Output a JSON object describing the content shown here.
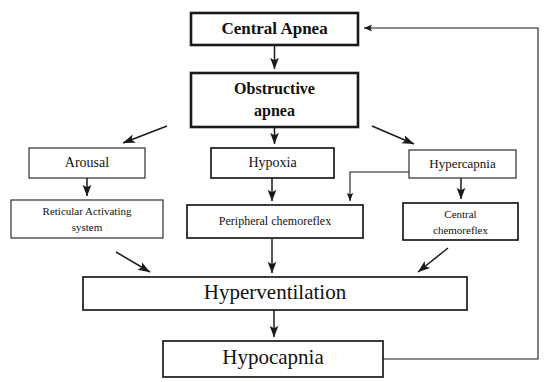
{
  "diagram": {
    "background_color": "#ffffff",
    "line_color": "#1a1a1a",
    "nodes": [
      {
        "id": "central-apnea",
        "label": "Central Apnea",
        "bold": true,
        "x": 191,
        "y": 13,
        "w": 167,
        "h": 32,
        "font_size": 17,
        "lines": [
          "Central Apnea"
        ]
      },
      {
        "id": "obstructive-apnea",
        "label": "Obstructive apnea",
        "bold": true,
        "x": 191,
        "y": 73,
        "w": 167,
        "h": 54,
        "font_size": 16,
        "lines": [
          "Obstructive",
          "apnea"
        ]
      },
      {
        "id": "arousal",
        "label": "Arousal",
        "bold": false,
        "x": 29,
        "y": 148,
        "w": 116,
        "h": 30,
        "font_size": 14,
        "lines": [
          "Arousal"
        ]
      },
      {
        "id": "hypoxia",
        "label": "Hypoxia",
        "bold": false,
        "x": 211,
        "y": 148,
        "w": 123,
        "h": 30,
        "font_size": 14,
        "lines": [
          "Hypoxia"
        ]
      },
      {
        "id": "hypercapnia",
        "label": "Hypercapnia",
        "bold": false,
        "x": 409,
        "y": 150,
        "w": 107,
        "h": 28,
        "font_size": 13,
        "lines": [
          "Hypercapnia"
        ]
      },
      {
        "id": "reticular-activating",
        "label": "Reticular Activating system",
        "bold": false,
        "x": 11,
        "y": 200,
        "w": 152,
        "h": 38,
        "font_size": 11,
        "lines": [
          "Reticular Activating",
          "system"
        ]
      },
      {
        "id": "peripheral-chemoreflex",
        "label": "Peripheral chemoreflex",
        "bold": false,
        "x": 187,
        "y": 205,
        "w": 176,
        "h": 33,
        "font_size": 12,
        "lines": [
          "Peripheral chemoreflex"
        ]
      },
      {
        "id": "central-chemoreflex",
        "label": "Central chemoreflex",
        "bold": false,
        "x": 403,
        "y": 203,
        "w": 115,
        "h": 37,
        "font_size": 11,
        "lines": [
          "Central",
          "chemoreflex"
        ]
      },
      {
        "id": "hyperventilation",
        "label": "Hyperventilation",
        "bold": false,
        "x": 83,
        "y": 277,
        "w": 384,
        "h": 33,
        "font_size": 21,
        "lines": [
          "Hyperventilation"
        ]
      },
      {
        "id": "hypocapnia",
        "label": "Hypocapnia",
        "bold": false,
        "x": 163,
        "y": 341,
        "w": 220,
        "h": 36,
        "font_size": 21,
        "lines": [
          "Hypocapnia"
        ]
      }
    ],
    "edges": [
      {
        "id": "central-to-obstructive",
        "from": "central-apnea",
        "to": "obstructive-apnea",
        "kind": "straight-down"
      },
      {
        "id": "obstructive-to-arousal",
        "from": "obstructive-apnea",
        "to": "arousal",
        "kind": "diagonal-left"
      },
      {
        "id": "obstructive-to-hypoxia",
        "from": "obstructive-apnea",
        "to": "hypoxia",
        "kind": "straight-down"
      },
      {
        "id": "obstructive-to-hypercapnia",
        "from": "obstructive-apnea",
        "to": "hypercapnia",
        "kind": "diagonal-right"
      },
      {
        "id": "arousal-to-reticular",
        "from": "arousal",
        "to": "reticular-activating",
        "kind": "straight-down"
      },
      {
        "id": "hypoxia-to-peripheral",
        "from": "hypoxia",
        "to": "peripheral-chemoreflex",
        "kind": "straight-down"
      },
      {
        "id": "hypercapnia-to-peripheral",
        "from": "hypercapnia",
        "to": "peripheral-chemoreflex",
        "kind": "elbow-left-down"
      },
      {
        "id": "hypercapnia-to-central-chemo",
        "from": "hypercapnia",
        "to": "central-chemoreflex",
        "kind": "straight-down"
      },
      {
        "id": "reticular-to-hyperventilation",
        "from": "reticular-activating",
        "to": "hyperventilation",
        "kind": "diagonal-right-down"
      },
      {
        "id": "peripheral-to-hyperventilation",
        "from": "peripheral-chemoreflex",
        "to": "hyperventilation",
        "kind": "straight-down"
      },
      {
        "id": "central-chemo-to-hyperventilation",
        "from": "central-chemoreflex",
        "to": "hyperventilation",
        "kind": "diagonal-left-down"
      },
      {
        "id": "hyperventilation-to-hypocapnia",
        "from": "hyperventilation",
        "to": "hypocapnia",
        "kind": "straight-down"
      },
      {
        "id": "hypocapnia-feedback-to-central",
        "from": "hypocapnia",
        "to": "central-apnea",
        "kind": "feedback-loop-right"
      }
    ]
  }
}
